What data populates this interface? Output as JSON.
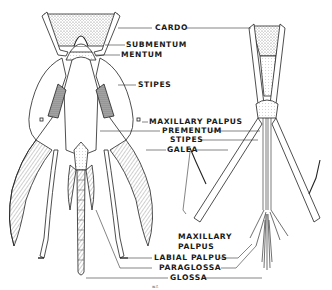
{
  "diagram": {
    "left_figure_labels": [
      {
        "id": "cardo",
        "text": "CARDO"
      },
      {
        "id": "submentum",
        "text": "SUBMENTUM"
      },
      {
        "id": "mentum",
        "text": "MENTUM"
      },
      {
        "id": "stipes",
        "text": "STIPES"
      },
      {
        "id": "maxillary_palpus",
        "text": "MAXILLARY PALPUS"
      },
      {
        "id": "prementum",
        "text": "PREMENTUM"
      },
      {
        "id": "stipes_2",
        "text": "STIPES"
      },
      {
        "id": "galea",
        "text": "GALEA"
      }
    ],
    "lower_labels": [
      {
        "id": "maxillary_palpus_2a",
        "text": "MAXILLARY"
      },
      {
        "id": "maxillary_palpus_2b",
        "text": "PALPUS"
      },
      {
        "id": "labial_palpus",
        "text": "LABIAL PALPUS"
      },
      {
        "id": "paraglossa",
        "text": "PARAGLOSSA"
      },
      {
        "id": "glossa",
        "text": "GLOSSA"
      }
    ],
    "signature": "w.f."
  }
}
